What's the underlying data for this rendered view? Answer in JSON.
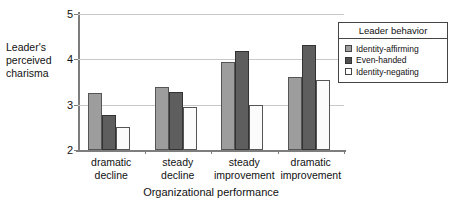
{
  "chart_data": {
    "type": "bar",
    "title": "",
    "xlabel": "Organizational performance",
    "ylabel": "Leader's perceived charisma",
    "ylabel_lines": [
      "Leader's",
      "perceived",
      "charisma"
    ],
    "ylim": [
      2,
      5
    ],
    "yticks": [
      2,
      3,
      4,
      5
    ],
    "ytick_labels": [
      "2",
      "3",
      "4",
      "5"
    ],
    "grid": true,
    "legend_title": "Leader behavior",
    "legend_position": "top-right",
    "categories": [
      "dramatic decline",
      "steady decline",
      "steady improvement",
      "dramatic improvement"
    ],
    "category_lines": [
      [
        "dramatic",
        "decline"
      ],
      [
        "steady",
        "decline"
      ],
      [
        "steady",
        "improvement"
      ],
      [
        "dramatic",
        "improvement"
      ]
    ],
    "series": [
      {
        "name": "Identity-affirming",
        "color": "#9d9d9d",
        "values": [
          3.25,
          3.4,
          3.95,
          3.62
        ]
      },
      {
        "name": "Even-handed",
        "color": "#5e5e5e",
        "values": [
          2.78,
          3.28,
          4.18,
          4.31
        ]
      },
      {
        "name": "Identity-negating",
        "color": "#fbfbfb",
        "values": [
          2.5,
          2.95,
          3.0,
          3.55
        ]
      }
    ]
  }
}
